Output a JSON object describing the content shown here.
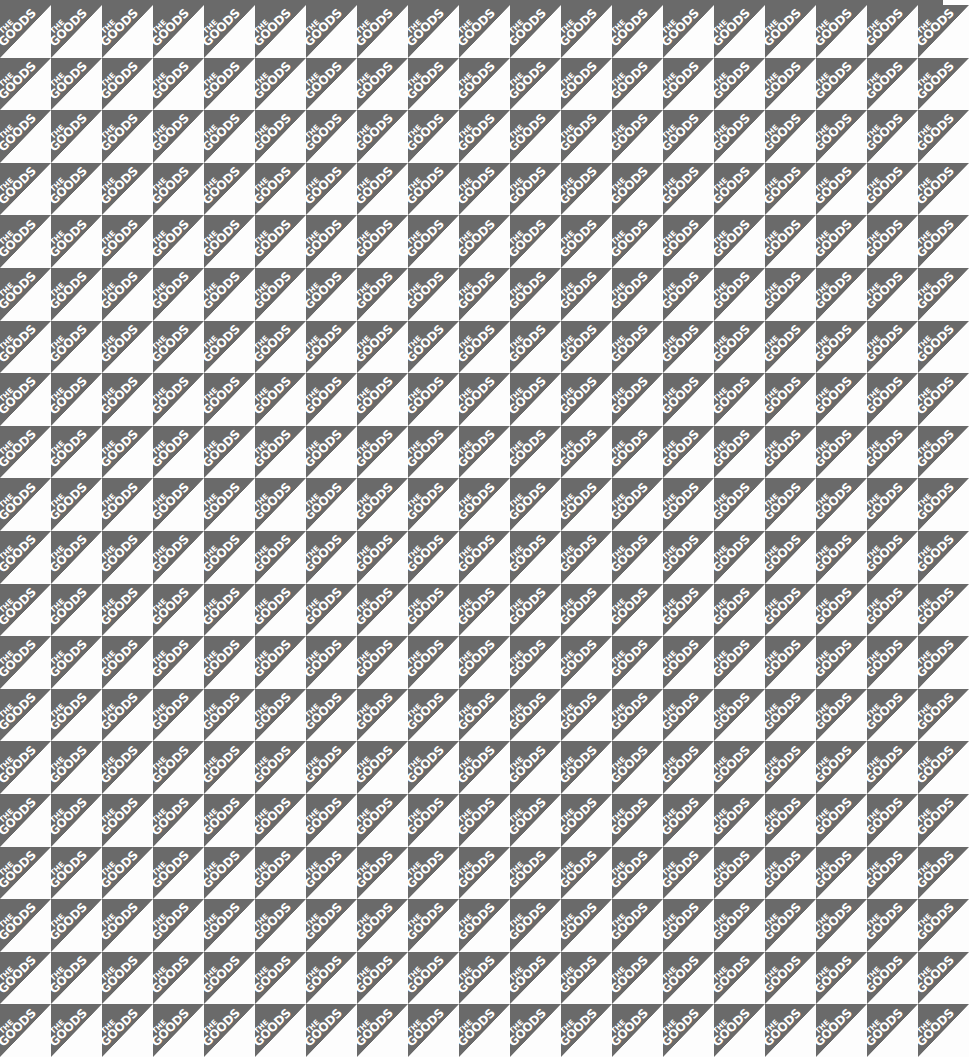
{
  "pattern": {
    "description": "Repeating diagonal-split tile pattern",
    "tile_text_line1": "THE",
    "tile_text_line2": "GOODS",
    "columns": 19,
    "rows": 20,
    "tile_width_px": 51,
    "tile_height_px": 52.6,
    "offset_top_px": 5,
    "colors": {
      "triangle_fill": "#6a6a6a",
      "background": "#fdfdfd",
      "text": "#ffffff"
    }
  }
}
